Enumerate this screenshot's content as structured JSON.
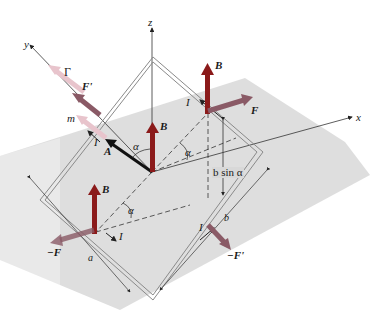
{
  "diagram": {
    "colors": {
      "plane_shade": "#dcdcdc",
      "field_arrow": "#8b1a1a",
      "force_arrow": "#8a5a66",
      "moment_arrow": "#e8c4cc",
      "area_vector": "#111111",
      "loop_wire": "#8a8a8a",
      "axis": "#333333"
    },
    "axes": {
      "x": "x",
      "y": "y",
      "z": "z"
    },
    "labels": {
      "B_center": "B",
      "B_top_right": "B",
      "B_bottom_left": "B",
      "F": "F",
      "F_prime": "F'",
      "neg_F": "−F",
      "neg_F_prime": "−F'",
      "gamma": "Γ",
      "m": "m",
      "A": "A",
      "I_left": "I",
      "I_top_right": "I",
      "I_bottom_left": "I",
      "I_bottom_right": "I",
      "alpha_center": "α",
      "alpha_right": "α",
      "alpha_bottom": "α",
      "b_sin_alpha": "b sin α",
      "dim_a": "a",
      "dim_b": "b"
    }
  }
}
